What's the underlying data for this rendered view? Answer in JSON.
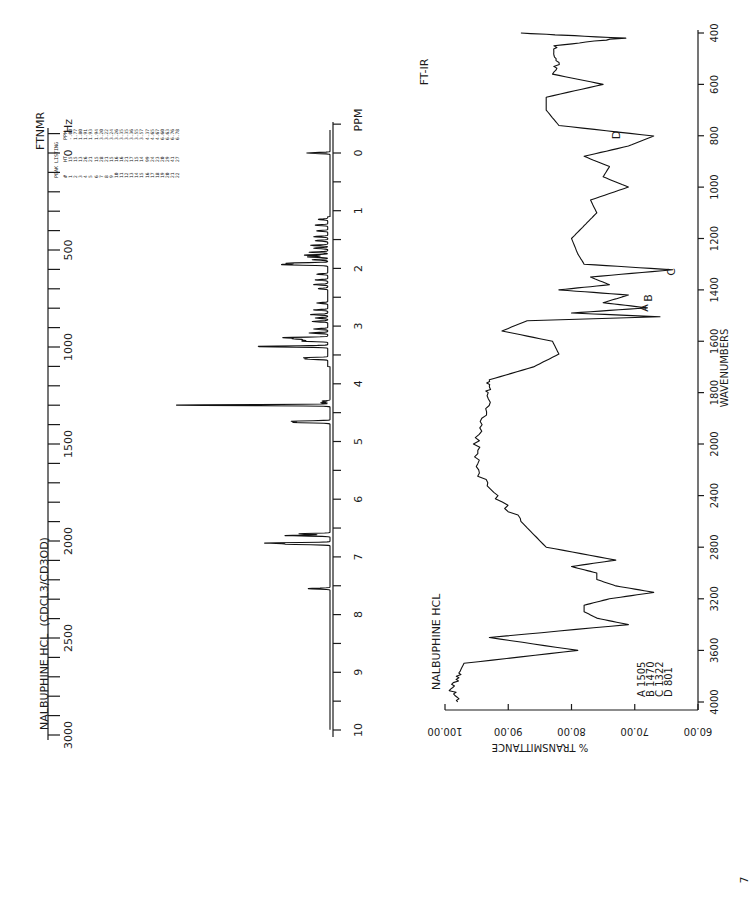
{
  "page": {
    "orientation": "rotated-90-clockwise",
    "page_number": "7"
  },
  "nmr": {
    "instrument": "FTNMR",
    "title": "NALBUPHINE HCL  (CDCL3/CD3OD)",
    "hz_unit": "Hz",
    "ppm_unit": "PPM",
    "hz_ticks": [
      "0",
      "500",
      "1000",
      "1500",
      "2000",
      "2500",
      "3000"
    ],
    "ppm_ticks": [
      "0",
      "1",
      "2",
      "3",
      "4",
      "5",
      "6",
      "7",
      "8",
      "9",
      "10"
    ],
    "peak_listing": {
      "title": "PEAK LISTING",
      "headers": [
        "#",
        "HT",
        "PPM"
      ],
      "rows": [
        [
          "1",
          "15",
          "-.00"
        ],
        [
          "2",
          "15",
          "1.77"
        ],
        [
          "3",
          "13",
          "1.80"
        ],
        [
          "4",
          "26",
          "1.91"
        ],
        [
          "5",
          "21",
          "1.93"
        ],
        [
          "6",
          "15",
          "1.94"
        ],
        [
          "7",
          "28",
          "3.20"
        ],
        [
          "8",
          "21",
          "3.22"
        ],
        [
          "9",
          "15",
          "3.24"
        ],
        [
          "10",
          "16",
          "3.26"
        ],
        [
          "11",
          "16",
          "3.35"
        ],
        [
          "12",
          "21",
          "3.35"
        ],
        [
          "13",
          "17",
          "3.36"
        ],
        [
          "14",
          "15",
          "3.55"
        ],
        [
          "15",
          "14",
          "3.57"
        ],
        [
          "16",
          "99",
          "4.37"
        ],
        [
          "17",
          "24",
          "4.65"
        ],
        [
          "18",
          "23",
          "4.67"
        ],
        [
          "19",
          "20",
          "6.60"
        ],
        [
          "20",
          "29",
          "6.63"
        ],
        [
          "21",
          "41",
          "6.76"
        ],
        [
          "22",
          "27",
          "6.78"
        ]
      ]
    }
  },
  "ir": {
    "instrument": "FT-IR",
    "title": "NALBUPHINE HCL",
    "xlabel": "WAVENUMBERS",
    "ylabel": "% TRANSMITTANCE",
    "x_ticks": [
      "4000",
      "3600",
      "3200",
      "2800",
      "2400",
      "2000",
      "1800",
      "1600",
      "1400",
      "1200",
      "1000",
      "800",
      "600",
      "400"
    ],
    "y_ticks": [
      "60.00",
      "70.00",
      "80.00",
      "90.00",
      "100.00"
    ],
    "peak_labels": [
      {
        "label": "A",
        "wavenumber": "1505"
      },
      {
        "label": "B",
        "wavenumber": "1470"
      },
      {
        "label": "C",
        "wavenumber": "1322"
      },
      {
        "label": "D",
        "wavenumber": "801"
      }
    ],
    "legend_lines": [
      "A 1505",
      "B 1470",
      "C 1322",
      "D 801"
    ]
  },
  "chart_data": [
    {
      "type": "line",
      "title": "NALBUPHINE HCL (CDCL3/CD3OD) FTNMR",
      "xlabel": "PPM",
      "x2label": "Hz",
      "ylabel": "",
      "xlim": [
        10,
        0
      ],
      "x2lim": [
        3000,
        0
      ],
      "grid": false,
      "peaks": [
        {
          "ppm": -0.0,
          "height": 15
        },
        {
          "ppm": 1.77,
          "height": 15
        },
        {
          "ppm": 1.8,
          "height": 13
        },
        {
          "ppm": 1.91,
          "height": 26
        },
        {
          "ppm": 1.93,
          "height": 21
        },
        {
          "ppm": 1.94,
          "height": 15
        },
        {
          "ppm": 3.2,
          "height": 28
        },
        {
          "ppm": 3.22,
          "height": 21
        },
        {
          "ppm": 3.24,
          "height": 15
        },
        {
          "ppm": 3.26,
          "height": 16
        },
        {
          "ppm": 3.35,
          "height": 16
        },
        {
          "ppm": 3.35,
          "height": 21
        },
        {
          "ppm": 3.36,
          "height": 17
        },
        {
          "ppm": 3.55,
          "height": 15
        },
        {
          "ppm": 3.57,
          "height": 14
        },
        {
          "ppm": 4.37,
          "height": 99
        },
        {
          "ppm": 4.65,
          "height": 24
        },
        {
          "ppm": 4.67,
          "height": 23
        },
        {
          "ppm": 6.6,
          "height": 20
        },
        {
          "ppm": 6.63,
          "height": 29
        },
        {
          "ppm": 6.76,
          "height": 41
        },
        {
          "ppm": 6.78,
          "height": 27
        },
        {
          "ppm": 7.55,
          "height": 14
        }
      ]
    },
    {
      "type": "line",
      "title": "NALBUPHINE HCL FT-IR",
      "xlabel": "WAVENUMBERS",
      "ylabel": "% TRANSMITTANCE",
      "xlim": [
        4000,
        400
      ],
      "ylim": [
        60,
        100
      ],
      "grid": false,
      "x": [
        4000,
        3900,
        3800,
        3700,
        3600,
        3500,
        3400,
        3350,
        3300,
        3250,
        3200,
        3150,
        3100,
        3050,
        3000,
        2950,
        2900,
        2800,
        2600,
        2400,
        2200,
        2000,
        1900,
        1800,
        1750,
        1700,
        1650,
        1600,
        1560,
        1520,
        1505,
        1490,
        1470,
        1450,
        1420,
        1400,
        1380,
        1350,
        1322,
        1300,
        1260,
        1200,
        1150,
        1100,
        1050,
        1000,
        960,
        920,
        880,
        840,
        801,
        760,
        700,
        650,
        600,
        560,
        500,
        450,
        420,
        400
      ],
      "y": [
        98,
        99,
        98,
        97,
        79,
        93,
        71,
        76,
        78,
        78,
        74,
        67,
        73,
        76,
        76,
        80,
        73,
        84,
        88,
        92,
        95,
        95,
        94,
        93,
        93,
        86,
        82,
        83,
        91,
        87,
        66,
        80,
        68,
        75,
        71,
        82,
        74,
        77,
        64,
        78,
        79,
        80,
        78,
        76,
        77,
        71,
        75,
        74,
        78,
        71,
        67,
        82,
        84,
        84,
        75,
        83,
        82,
        83,
        72,
        88
      ],
      "annotations": [
        {
          "label": "A",
          "x": 1505
        },
        {
          "label": "B",
          "x": 1470
        },
        {
          "label": "C",
          "x": 1322
        },
        {
          "label": "D",
          "x": 801
        }
      ]
    }
  ]
}
